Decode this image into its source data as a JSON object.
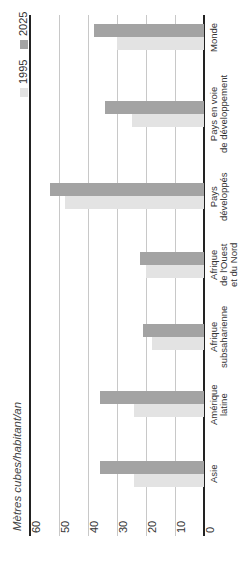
{
  "chart_data": {
    "type": "bar",
    "orientation": "rotated-90-ccw (vertical bars printed sideways)",
    "title": "",
    "ylabel": "Mètres cubes/habitant/an",
    "xlabel": "",
    "ylim": [
      0,
      60
    ],
    "yticks": [
      "0",
      "10",
      "20",
      "30",
      "40",
      "50",
      "60"
    ],
    "grid": true,
    "legend_position": "top-left (rotated)",
    "categories": [
      "Asie",
      "Amérique latine",
      "Afrique subsaharienne",
      "Afrique de l'Ouest et du Nord",
      "Pays développés",
      "Pays en voie de développement",
      "Monde"
    ],
    "series": [
      {
        "name": "1995",
        "color": "#e3e3e3",
        "values": [
          24,
          24,
          18,
          20,
          48,
          25,
          30
        ]
      },
      {
        "name": "2025",
        "color": "#a3a3a3",
        "values": [
          36,
          36,
          21,
          22,
          53,
          34,
          38
        ]
      }
    ]
  },
  "labels": {
    "ytitle": "Mètres cubes/habitant/an",
    "ticks": [
      "0",
      "10",
      "20",
      "30",
      "40",
      "50",
      "60"
    ],
    "legend": [
      "1995",
      "2025"
    ],
    "categories": [
      [
        "Asie"
      ],
      [
        "Amérique",
        "latine"
      ],
      [
        "Afrique",
        "subsaharienne"
      ],
      [
        "Afrique",
        "de l'Ouest",
        "et du Nord"
      ],
      [
        "Pays",
        "développés"
      ],
      [
        "Pays en voie",
        "de développement"
      ],
      [
        "Monde"
      ]
    ]
  }
}
